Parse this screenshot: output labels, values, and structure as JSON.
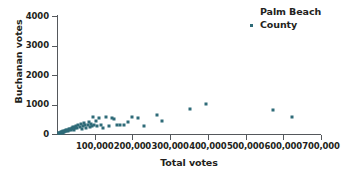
{
  "chart_data": {
    "type": "scatter",
    "title": "",
    "xlabel": "Total votes",
    "ylabel": "Buchanan votes",
    "xlim": [
      0,
      700000
    ],
    "ylim": [
      0,
      4000
    ],
    "grid": false,
    "legend_position": "top-right",
    "marker_color": "#2e6b78",
    "axis_color": "#55585c",
    "text_color": "#231f20",
    "xticks": [
      0,
      100000,
      200000,
      300000,
      400000,
      500000,
      600000,
      700000
    ],
    "xtick_labels": [
      "",
      "100,000",
      "200,000",
      "300,000",
      "400,000",
      "500,000",
      "600,000",
      "700,000"
    ],
    "yticks": [
      0,
      1000,
      2000,
      3000,
      4000
    ],
    "ytick_labels": [
      "0",
      "1000",
      "2000",
      "3000",
      "4000"
    ],
    "series": [
      {
        "name": "Palm Beach County",
        "marker": "square",
        "color": "#2e6b78",
        "points": [
          [
            4000,
            20
          ],
          [
            6000,
            30
          ],
          [
            8000,
            45
          ],
          [
            9500,
            40
          ],
          [
            11000,
            60
          ],
          [
            12500,
            55
          ],
          [
            14000,
            75
          ],
          [
            15500,
            50
          ],
          [
            17000,
            90
          ],
          [
            18500,
            70
          ],
          [
            20000,
            105
          ],
          [
            21500,
            85
          ],
          [
            23000,
            120
          ],
          [
            25000,
            95
          ],
          [
            27000,
            140
          ],
          [
            29000,
            110
          ],
          [
            31000,
            160
          ],
          [
            33000,
            130
          ],
          [
            35000,
            180
          ],
          [
            37000,
            145
          ],
          [
            39000,
            200
          ],
          [
            41000,
            165
          ],
          [
            43000,
            225
          ],
          [
            45000,
            120
          ],
          [
            47000,
            250
          ],
          [
            49000,
            190
          ],
          [
            51000,
            270
          ],
          [
            54000,
            215
          ],
          [
            57000,
            300
          ],
          [
            60000,
            240
          ],
          [
            63000,
            330
          ],
          [
            66000,
            155
          ],
          [
            69000,
            270
          ],
          [
            72000,
            360
          ],
          [
            75000,
            290
          ],
          [
            78000,
            200
          ],
          [
            81000,
            320
          ],
          [
            84000,
            420
          ],
          [
            87000,
            240
          ],
          [
            90000,
            350
          ],
          [
            93000,
            275
          ],
          [
            96000,
            560
          ],
          [
            99000,
            300
          ],
          [
            103000,
            450
          ],
          [
            107000,
            255
          ],
          [
            111000,
            540
          ],
          [
            116000,
            310
          ],
          [
            122000,
            200
          ],
          [
            130000,
            560
          ],
          [
            138000,
            280
          ],
          [
            145000,
            540
          ],
          [
            152000,
            520
          ],
          [
            160000,
            320
          ],
          [
            168000,
            290
          ],
          [
            178000,
            310
          ],
          [
            188000,
            400
          ],
          [
            200000,
            560
          ],
          [
            215000,
            550
          ],
          [
            232000,
            280
          ],
          [
            265000,
            650
          ],
          [
            278000,
            440
          ],
          [
            352000,
            850
          ],
          [
            394000,
            1010
          ],
          [
            572000,
            800
          ],
          [
            622000,
            580
          ]
        ]
      }
    ]
  },
  "axis": {
    "x_title": "Total votes",
    "y_title": "Buchanan votes"
  },
  "legend": {
    "line_1": "Palm Beach",
    "line_2": "County"
  }
}
